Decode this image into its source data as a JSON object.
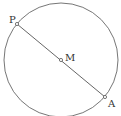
{
  "diagram": {
    "type": "geometry",
    "colors": {
      "stroke": "#555555",
      "text": "#333333",
      "background": "#ffffff"
    },
    "circle": {
      "cx": 61,
      "cy": 60,
      "r": 57
    },
    "points": [
      {
        "id": "P",
        "label": "P",
        "x": 17,
        "y": 24
      },
      {
        "id": "M",
        "label": "M",
        "x": 61,
        "y": 60
      },
      {
        "id": "A",
        "label": "A",
        "x": 105,
        "y": 97
      }
    ],
    "segments": [
      {
        "from": "P",
        "to": "A"
      }
    ]
  }
}
